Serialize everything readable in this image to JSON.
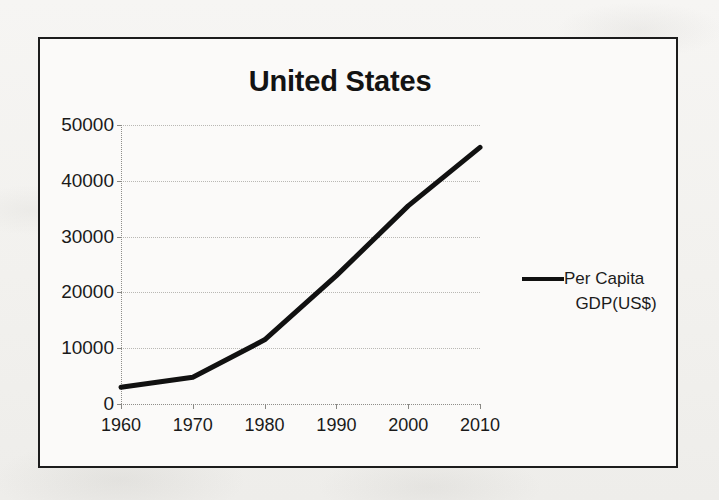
{
  "chart_data": {
    "type": "line",
    "title": "United States",
    "xlabel": "",
    "ylabel": "",
    "x": [
      1960,
      1970,
      1980,
      1990,
      2000,
      2010
    ],
    "xtick_labels": [
      "1960",
      "1970",
      "1980",
      "1990",
      "2000",
      "2010"
    ],
    "ytick_labels": [
      "0",
      "10000",
      "20000",
      "30000",
      "40000",
      "50000"
    ],
    "yticks": [
      0,
      10000,
      20000,
      30000,
      40000,
      50000
    ],
    "ylim": [
      0,
      50000
    ],
    "xlim": [
      1960,
      2010
    ],
    "grid": "horizontal-dotted",
    "legend_position": "right",
    "series": [
      {
        "name": "Per Capita GDP(US$)",
        "name_line1": "Per Capita",
        "name_line2": "GDP(US$)",
        "color": "#111111",
        "values": [
          3000,
          4800,
          11500,
          23000,
          35500,
          46000
        ]
      }
    ],
    "annotations": []
  },
  "frame": {
    "border_color": "#1c1c1c",
    "plot_background": "#fbfaf9"
  },
  "page": {
    "background": "#f4f3f1"
  }
}
